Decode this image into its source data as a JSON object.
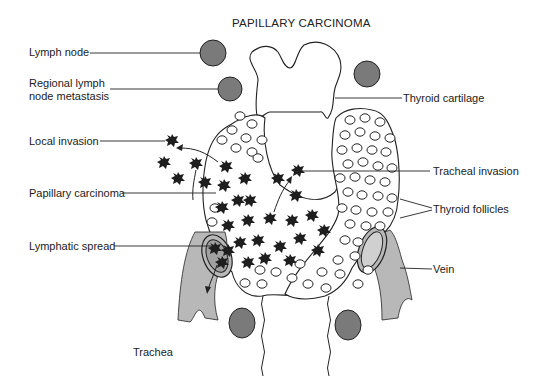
{
  "title": "PAPILLARY CARCINOMA",
  "labels": {
    "lymph_node": "Lymph node",
    "regional_line1": "Regional lymph",
    "regional_line2": "node metastasis",
    "local_invasion": "Local invasion",
    "papillary_carcinoma": "Papillary carcinoma",
    "lymphatic_spread": "Lymphatic spread",
    "trachea": "Trachea",
    "thyroid_cartilage": "Thyroid cartilage",
    "tracheal_invasion": "Tracheal invasion",
    "thyroid_follicles": "Thyroid follicles",
    "vein": "Vein"
  },
  "colors": {
    "lymph_node_fill": "#7a7a7a",
    "vessel_fill": "#b8b8b8",
    "carcinoma_fill": "#1e1e1e",
    "outline": "#222222",
    "text": "#222222"
  }
}
